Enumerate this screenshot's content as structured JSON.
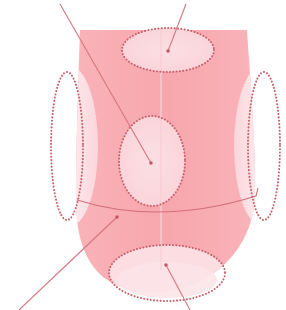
{
  "diagram": {
    "colors": {
      "background": "#ffffff",
      "tongue_body": "#f7a9b0",
      "tongue_body_light": "#f9bec4",
      "zone_fill": "#fbdde2",
      "zone_fill_edge": "#fce6ea",
      "dotted_outline": "#c8606a",
      "leader_line": "#d77580",
      "midline": "#f4c3c8"
    },
    "tongue": {
      "top_left": [
        80,
        30
      ],
      "top_right": [
        247,
        30
      ],
      "bottom": [
        152,
        292
      ]
    },
    "zones": [
      {
        "id": "root",
        "shape": "ellipse",
        "cx": 168,
        "cy": 50,
        "rx": 46,
        "ry": 22
      },
      {
        "id": "center",
        "shape": "ellipse",
        "cx": 152,
        "cy": 161,
        "rx": 33,
        "ry": 45
      },
      {
        "id": "left-edge",
        "shape": "ellipse",
        "cx": 67,
        "cy": 146,
        "rx": 16,
        "ry": 74
      },
      {
        "id": "right-edge",
        "shape": "ellipse",
        "cx": 264,
        "cy": 146,
        "rx": 16,
        "ry": 74
      },
      {
        "id": "tip",
        "shape": "ellipse",
        "cx": 167,
        "cy": 273,
        "rx": 58,
        "ry": 28
      }
    ],
    "leader_lines": [
      {
        "id": "root-leader",
        "from": [
          168,
          51
        ],
        "to": [
          186,
          4
        ]
      },
      {
        "id": "center-leader",
        "from": [
          151,
          163
        ],
        "to": [
          60,
          4
        ]
      },
      {
        "id": "tip-leader",
        "from": [
          166,
          265
        ],
        "to": [
          190,
          310
        ]
      },
      {
        "id": "boundary-leader",
        "from": [
          117,
          217
        ],
        "to": [
          19,
          310
        ]
      }
    ],
    "boundary_curve": {
      "from": [
        77,
        200
      ],
      "via": [
        160,
        222
      ],
      "to": [
        256,
        196
      ]
    },
    "labels": []
  }
}
